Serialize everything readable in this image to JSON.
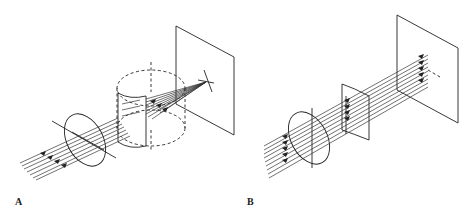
{
  "figure": {
    "panels": [
      {
        "id": "A",
        "label": "A",
        "description": "Parallel rays pass through a circular aperture and a cylindrical lens, converging to a line focus on a screen"
      },
      {
        "id": "B",
        "label": "B",
        "description": "Parallel rays pass through a circular aperture and a cylindrical element, remaining parallel to the screen"
      }
    ],
    "colors": {
      "line": "#222222",
      "background": "#ffffff"
    }
  }
}
